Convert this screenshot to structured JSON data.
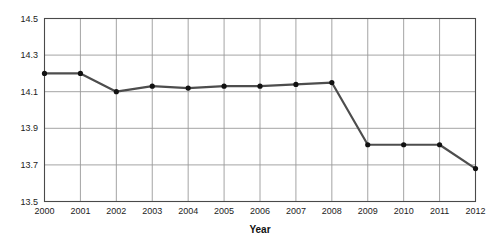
{
  "chart_data": {
    "type": "line",
    "title": "",
    "subtitle": "",
    "xlabel": "Year",
    "ylabel": "",
    "categories": [
      "2000",
      "2001",
      "2002",
      "2003",
      "2004",
      "2005",
      "2006",
      "2007",
      "2008",
      "2009",
      "2010",
      "2011",
      "2012"
    ],
    "values": [
      14.2,
      14.2,
      14.1,
      14.13,
      14.12,
      14.13,
      14.13,
      14.14,
      14.15,
      13.81,
      13.81,
      13.81,
      13.68
    ],
    "series": [
      {
        "name": "",
        "values": [
          14.2,
          14.2,
          14.1,
          14.13,
          14.12,
          14.13,
          14.13,
          14.14,
          14.15,
          13.81,
          13.81,
          13.81,
          13.68
        ]
      }
    ],
    "ylim": [
      13.5,
      14.5
    ],
    "yticks": [
      "14.5",
      "14.3",
      "14.1",
      "13.9",
      "13.7",
      "13.5"
    ],
    "ytick_values": [
      14.5,
      14.3,
      14.1,
      13.9,
      13.7,
      13.5
    ],
    "xticks": [
      "2000",
      "2001",
      "2002",
      "2003",
      "2004",
      "2005",
      "2006",
      "2007",
      "2008",
      "2009",
      "2010",
      "2011",
      "2012"
    ],
    "grid": "both",
    "legend": "none",
    "annotations": [],
    "colors": {
      "line": "#4d4d4d",
      "marker": "#111111",
      "grid": "#9a9a9a",
      "axis": "#4a4a4a",
      "background": "#ffffff",
      "text": "#1c1c1c"
    },
    "line_width": 2.2,
    "marker_radius": 2.6
  },
  "axis": {
    "x_title": "Year"
  }
}
